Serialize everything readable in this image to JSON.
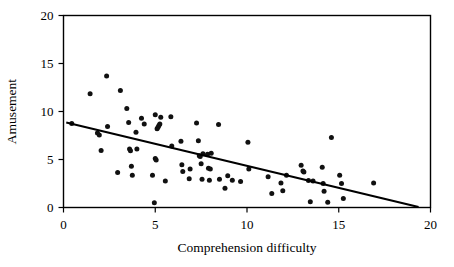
{
  "chart_data": {
    "type": "scatter",
    "title": "",
    "xlabel": "Comprehension difficulty",
    "ylabel": "Amusement",
    "xlim": [
      0,
      20
    ],
    "ylim": [
      0,
      20
    ],
    "xticks": [
      0,
      5,
      10,
      15,
      20
    ],
    "yticks": [
      0,
      5,
      10,
      15,
      20
    ],
    "xtick_labels": [
      "0",
      "5",
      "10",
      "15",
      "20"
    ],
    "ytick_labels": [
      "0",
      "5",
      "10",
      "15",
      "20"
    ],
    "grid": false,
    "legend": null,
    "marker": "filled-circle",
    "marker_color": "#111111",
    "frame_color": "#000000",
    "trend_line": {
      "label": "linear regression fit",
      "color": "#000000",
      "x_start": 0.15,
      "y_start": 8.85,
      "x_end": 19.35,
      "y_end": 0.05,
      "slope": -0.458,
      "intercept": 8.92
    },
    "points": [
      [
        0.45,
        8.75
      ],
      [
        1.45,
        11.85
      ],
      [
        1.85,
        7.75
      ],
      [
        1.95,
        7.55
      ],
      [
        2.05,
        5.95
      ],
      [
        2.35,
        13.7
      ],
      [
        2.4,
        8.45
      ],
      [
        2.95,
        3.65
      ],
      [
        3.1,
        12.2
      ],
      [
        3.45,
        10.3
      ],
      [
        3.55,
        8.85
      ],
      [
        3.6,
        6.1
      ],
      [
        3.65,
        5.9
      ],
      [
        3.7,
        4.3
      ],
      [
        3.75,
        3.35
      ],
      [
        3.95,
        7.85
      ],
      [
        4.0,
        6.1
      ],
      [
        4.25,
        9.3
      ],
      [
        4.4,
        8.7
      ],
      [
        4.85,
        3.35
      ],
      [
        4.95,
        0.5
      ],
      [
        5.0,
        9.65
      ],
      [
        5.0,
        5.1
      ],
      [
        5.05,
        4.95
      ],
      [
        5.1,
        8.2
      ],
      [
        5.15,
        8.35
      ],
      [
        5.2,
        8.55
      ],
      [
        5.25,
        8.7
      ],
      [
        5.3,
        9.4
      ],
      [
        5.55,
        2.75
      ],
      [
        5.85,
        9.45
      ],
      [
        5.9,
        6.4
      ],
      [
        6.4,
        6.9
      ],
      [
        6.45,
        4.45
      ],
      [
        6.5,
        3.75
      ],
      [
        6.85,
        3.0
      ],
      [
        6.9,
        4.0
      ],
      [
        7.25,
        8.8
      ],
      [
        7.35,
        6.95
      ],
      [
        7.4,
        5.4
      ],
      [
        7.45,
        5.3
      ],
      [
        7.5,
        4.55
      ],
      [
        7.55,
        2.95
      ],
      [
        7.6,
        5.6
      ],
      [
        7.85,
        5.55
      ],
      [
        7.9,
        4.1
      ],
      [
        7.95,
        2.85
      ],
      [
        8.0,
        4.0
      ],
      [
        8.05,
        5.65
      ],
      [
        8.45,
        8.65
      ],
      [
        8.5,
        2.95
      ],
      [
        8.8,
        2.0
      ],
      [
        8.95,
        3.3
      ],
      [
        9.2,
        2.85
      ],
      [
        9.65,
        2.7
      ],
      [
        10.05,
        6.8
      ],
      [
        10.1,
        4.0
      ],
      [
        11.15,
        3.2
      ],
      [
        11.35,
        1.45
      ],
      [
        11.85,
        2.55
      ],
      [
        11.95,
        1.75
      ],
      [
        12.15,
        3.35
      ],
      [
        12.95,
        4.4
      ],
      [
        13.05,
        3.8
      ],
      [
        13.1,
        3.7
      ],
      [
        13.35,
        2.8
      ],
      [
        13.45,
        0.6
      ],
      [
        13.6,
        2.75
      ],
      [
        14.1,
        4.2
      ],
      [
        14.15,
        2.5
      ],
      [
        14.2,
        1.7
      ],
      [
        14.4,
        0.55
      ],
      [
        14.6,
        7.3
      ],
      [
        15.05,
        3.35
      ],
      [
        15.15,
        2.5
      ],
      [
        15.25,
        0.95
      ],
      [
        16.9,
        2.55
      ]
    ]
  }
}
